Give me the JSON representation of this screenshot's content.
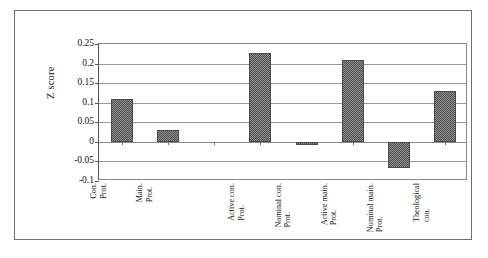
{
  "chart_data": {
    "type": "bar",
    "title": "",
    "subtitle": "",
    "xlabel": "",
    "ylabel": "Z score",
    "ylim": [
      -0.1,
      0.25
    ],
    "yticks": [
      0.25,
      0.2,
      0.15,
      0.1,
      0.05,
      0,
      -0.05,
      -0.1
    ],
    "ytick_labels": [
      "0.25",
      "0.2",
      "0.15",
      "0.1",
      "0.05",
      "0",
      "-0.05",
      "-0.1"
    ],
    "grid": true,
    "legend": "none",
    "categories": [
      "Con. Prot.",
      "Main. Prot.",
      "",
      "Active con. Prot.",
      "Nominal con. Prot.",
      "Active main. Prot.",
      "Nominal main. Prot.",
      "Theological con."
    ],
    "category_lines": [
      [
        "Con.",
        "Prot."
      ],
      [
        "Main.",
        "Prot."
      ],
      [
        "",
        ""
      ],
      [
        "Active con.",
        "Prot."
      ],
      [
        "Nominal con.",
        "Prot."
      ],
      [
        "Active main.",
        "Prot."
      ],
      [
        "Nominal main.",
        "Prot."
      ],
      [
        "Theological",
        "con."
      ]
    ],
    "values": [
      0.11,
      0.03,
      null,
      0.228,
      -0.008,
      0.208,
      -0.068,
      0.13
    ],
    "bar_color": "#8f8f8f",
    "bar_border_color": "#4a4a4a",
    "gridline_color": "#9a9a9a",
    "frame_color": "#6e6e6e"
  },
  "axis": {
    "y_title": "Z score"
  }
}
